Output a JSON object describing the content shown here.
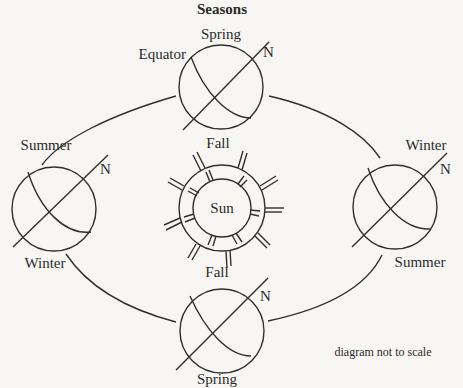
{
  "title": "Seasons",
  "note": "diagram not to scale",
  "sun": {
    "label": "Sun",
    "center_label": "Fall"
  },
  "earths": [
    {
      "position": "top",
      "top_label": "Spring",
      "side_label": "Equator",
      "axis_label": "N"
    },
    {
      "position": "left",
      "top_label": "Summer",
      "bottom_label": "Winter",
      "axis_label": "N"
    },
    {
      "position": "right",
      "top_label": "Winter",
      "bottom_label": "Summer",
      "axis_label": "N"
    },
    {
      "position": "bottom",
      "top_label": "Fall",
      "bottom_label": "Spring",
      "axis_label": "N"
    }
  ],
  "colors": {
    "line": "#2f2f2f",
    "background": "#f7f6f3"
  }
}
